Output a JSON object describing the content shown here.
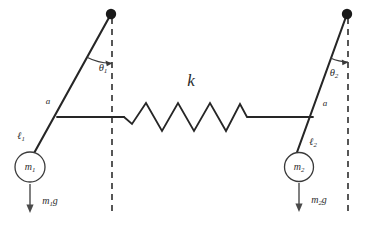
{
  "figure": {
    "kind": "physics-diagram",
    "background_color": "#ffffff",
    "ink_color": "#262626"
  },
  "labels": {
    "spring_constant": "k",
    "angle_left": "θ",
    "angle_left_sub": "1",
    "angle_right": "θ",
    "angle_right_sub": "2",
    "attach_left": "a",
    "attach_right": "a",
    "length_left": "ℓ",
    "length_left_sub": "1",
    "length_right": "ℓ",
    "length_right_sub": "2",
    "mass_left": "m",
    "mass_left_sub": "1",
    "mass_right": "m",
    "mass_right_sub": "2",
    "weight_left": "m",
    "weight_left_sub": "1",
    "weight_left_tail": "g",
    "weight_right": "m",
    "weight_right_sub": "2",
    "weight_right_tail": "g"
  },
  "geometry": {
    "left_pivot": {
      "x": 111,
      "y": 14
    },
    "right_pivot": {
      "x": 347,
      "y": 14
    },
    "left_mass_center": {
      "x": 30,
      "y": 167
    },
    "right_mass_center": {
      "x": 299,
      "y": 167
    },
    "left_mass_radius": 15,
    "right_mass_radius": 14.5,
    "pivot_radius": 5,
    "connector_y": 117,
    "left_attach": {
      "x": 57,
      "y": 117
    },
    "right_attach": {
      "x": 313,
      "y": 117
    },
    "spring_left_end": {
      "x": 124,
      "y": 117
    },
    "spring_right_end": {
      "x": 253,
      "y": 117
    },
    "spring_coils": 4,
    "spring_amplitude": 15,
    "left_dashed": {
      "x": 112,
      "y_top": 18,
      "y_bottom": 215
    },
    "right_dashed": {
      "x": 348,
      "y_top": 18,
      "y_bottom": 215
    },
    "left_force_arrow": {
      "x": 30,
      "y_top": 184,
      "y_bottom": 212
    },
    "right_force_arrow": {
      "x": 299,
      "y_top": 183,
      "y_bottom": 211
    }
  },
  "label_positions": {
    "k": {
      "x": 191,
      "y": 82
    },
    "theta_1": {
      "x": 104,
      "y": 69
    },
    "theta_2": {
      "x": 334,
      "y": 74
    },
    "a_left": {
      "x": 48,
      "y": 102
    },
    "a_right": {
      "x": 325,
      "y": 104
    },
    "ell_1": {
      "x": 21,
      "y": 137
    },
    "ell_2": {
      "x": 313,
      "y": 143
    },
    "m_1": {
      "x": 30,
      "y": 168
    },
    "m_2": {
      "x": 299,
      "y": 168
    },
    "m_1_g": {
      "x": 50,
      "y": 202
    },
    "m_2_g": {
      "x": 319,
      "y": 201
    }
  }
}
